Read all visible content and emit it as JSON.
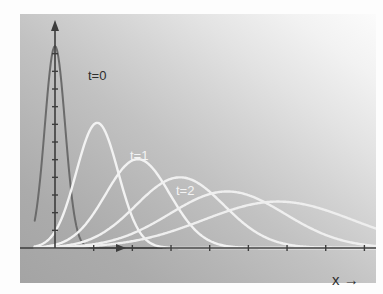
{
  "figure": {
    "name": "diffusion-gaussian-spreading-plot",
    "background_color": "#ffffff",
    "panel": {
      "x": 20,
      "y": 14,
      "width": 356,
      "height": 269,
      "gradient_from": "#fbfbfb",
      "gradient_to": "#a4a4a4",
      "gradient_direction": "top-right to bottom-left"
    }
  },
  "axes": {
    "origin_x": 35,
    "origin_y": 234,
    "vertical_axis": {
      "name": "y-axis",
      "color": "#3d3d3d",
      "has_arrowhead": true,
      "tick_count": 11
    },
    "horizontal_axis": {
      "name": "x-axis",
      "color": "#3d3d3d",
      "has_arrowhead": true,
      "tick_count": 8
    },
    "x_axis_label": "x →",
    "x_axis_label_color": "#2e2e2e"
  },
  "labels": [
    {
      "text": "t=0",
      "color": "#2e2e2e"
    },
    {
      "text": "t=1",
      "color": "#f4f4f4"
    },
    {
      "text": "t=2",
      "color": "#f4f4f4"
    }
  ],
  "chart_data": {
    "type": "line",
    "title": "",
    "xlabel": "x →",
    "ylabel": "",
    "grid": false,
    "legend": "inline-annotations",
    "xlim": [
      -0.6,
      9.5
    ],
    "ylim": [
      0,
      1.05
    ],
    "series": [
      {
        "name": "t=0",
        "label": "t=0",
        "color": "#6b6b6b",
        "stroke_width": 2.0,
        "peak_x": 0.0,
        "peak_y": 1.0,
        "sigma": 0.3,
        "labeled": true
      },
      {
        "name": "t=1",
        "label": "t=1",
        "color": "#f2f2f2",
        "stroke_width": 2.4,
        "peak_x": 1.25,
        "peak_y": 0.62,
        "sigma": 0.62,
        "labeled": true
      },
      {
        "name": "t=2",
        "label": "t=2",
        "color": "#f2f2f2",
        "stroke_width": 2.4,
        "peak_x": 2.45,
        "peak_y": 0.44,
        "sigma": 0.95,
        "labeled": true
      },
      {
        "name": "t=3",
        "label": "",
        "color": "#f0f0f0",
        "stroke_width": 2.4,
        "peak_x": 3.7,
        "peak_y": 0.35,
        "sigma": 1.3,
        "labeled": false
      },
      {
        "name": "t=4",
        "label": "",
        "color": "#efefef",
        "stroke_width": 2.4,
        "peak_x": 5.1,
        "peak_y": 0.28,
        "sigma": 1.7,
        "labeled": false
      },
      {
        "name": "t=5",
        "label": "",
        "color": "#eeeeee",
        "stroke_width": 2.4,
        "peak_x": 6.6,
        "peak_y": 0.23,
        "sigma": 2.2,
        "labeled": false
      }
    ]
  }
}
